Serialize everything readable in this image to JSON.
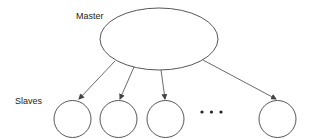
{
  "diagram": {
    "labels": {
      "master": "Master",
      "slaves": "Slaves"
    },
    "master_node": {
      "cx": 159,
      "cy": 39,
      "rx": 59,
      "ry": 31
    },
    "slave_nodes": [
      {
        "id": "slave-1",
        "cx": 72.5,
        "cy": 119,
        "r": 18.5
      },
      {
        "id": "slave-2",
        "cx": 118.5,
        "cy": 119,
        "r": 18.5
      },
      {
        "id": "slave-3",
        "cx": 165.5,
        "cy": 119,
        "r": 18.5
      },
      {
        "id": "slave-n",
        "cx": 277.5,
        "cy": 119,
        "r": 18.5
      }
    ],
    "edges": [
      {
        "from": "master",
        "to": "slave-1",
        "x1": 115,
        "y1": 61,
        "x2": 79,
        "y2": 99
      },
      {
        "from": "master",
        "to": "slave-2",
        "x1": 134,
        "y1": 67,
        "x2": 120,
        "y2": 99
      },
      {
        "from": "master",
        "to": "slave-3",
        "x1": 161,
        "y1": 70,
        "x2": 165,
        "y2": 99
      },
      {
        "from": "master",
        "to": "slave-n",
        "x1": 203,
        "y1": 60,
        "x2": 276,
        "y2": 99
      }
    ],
    "ellipsis": "• • •",
    "colors": {
      "stroke": "#444444",
      "text": "#222222",
      "background": "#ffffff"
    }
  }
}
